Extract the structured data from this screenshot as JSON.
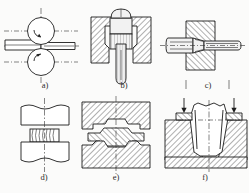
{
  "figure": {
    "background_color": "#fbfbfa",
    "line_color": "#1c1c1c",
    "hatch_color": "#1c1c1c",
    "panel_count": 6,
    "rows": 2,
    "columns": 3
  },
  "panels": [
    {
      "id": "a",
      "label": "a)",
      "process": "rolling",
      "description": "Two rotating rolls reduce the thickness of a flat workpiece passing between them",
      "elements": {
        "upper_roll": "circle",
        "lower_roll": "circle",
        "workpiece": "flat-bar",
        "rotation_arrows": 2,
        "centerlines": 3
      }
    },
    {
      "id": "b",
      "label": "b)",
      "process": "extrusion",
      "description": "A punch forces billet material through a die orifice producing a rod",
      "elements": {
        "container": "hatched-walls",
        "punch": "rounded-head",
        "billet": "vertical-striped",
        "extrudate": "rod-with-round-tip"
      }
    },
    {
      "id": "c",
      "label": "c)",
      "process": "drawing",
      "description": "A rod is pulled through a tapered die reducing its diameter",
      "elements": {
        "die_block": "hatched",
        "entry_rod": "thick",
        "exit_rod": "thin",
        "taper_zone": "conical",
        "centerline": "horizontal"
      }
    },
    {
      "id": "d",
      "label": "d)",
      "process": "upsetting",
      "description": "Open die forging, a billet is compressed between two flat dies and barrels outward",
      "elements": {
        "upper_die": "flat-block",
        "lower_die": "flat-block",
        "workpiece": "barrel-shaped",
        "centerline": "vertical"
      }
    },
    {
      "id": "e",
      "label": "e)",
      "process": "die-forging",
      "description": "Closed die forging, matched upper and lower dies shape the part with flash at the parting line",
      "elements": {
        "upper_die": "hatched-with-cavity",
        "lower_die": "hatched-with-cavity",
        "workpiece": "forged-part-with-flash",
        "centerline": "vertical"
      }
    },
    {
      "id": "f",
      "label": "f)",
      "process": "deep-drawing",
      "description": "A punch force draws sheet metal into a die cavity forming a cup",
      "elements": {
        "die_block": "hatched",
        "blank_holders": 2,
        "cup": "tapered-wall",
        "force_arrows": 2,
        "centerlines": 2
      }
    }
  ],
  "labels": {
    "a": "a)",
    "b": "b)",
    "c": "c)",
    "d": "d)",
    "e": "e)",
    "f": "f)"
  }
}
